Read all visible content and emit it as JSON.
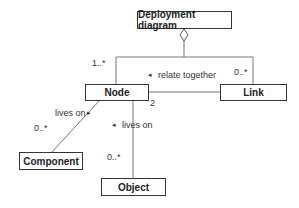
{
  "diagram": {
    "nodes": {
      "deployment": "Deployment diagram",
      "node": "Node",
      "link": "Link",
      "component": "Component",
      "object": "Object"
    },
    "edges": {
      "aggregation_node_mult": "1..*",
      "aggregation_link_mult": "0..*",
      "relate_label": "relate together",
      "relate_arrow": "◂",
      "node_link_mult": "2",
      "component_label": "lives on",
      "component_arrow": "▸",
      "component_mult": "0..*",
      "object_label": "lives on",
      "object_arrow": "◂",
      "object_mult": "0..*"
    }
  }
}
